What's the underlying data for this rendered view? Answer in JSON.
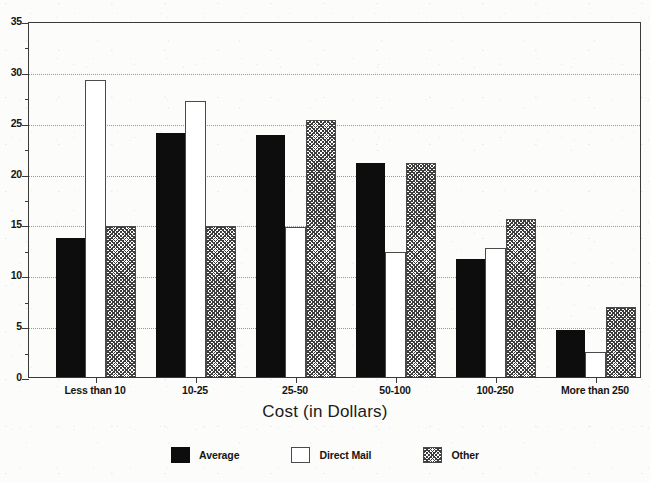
{
  "chart_data": {
    "type": "bar",
    "title": "",
    "xlabel": "Cost (in Dollars)",
    "ylabel": "",
    "categories": [
      "Less than 10",
      "10-25",
      "25-50",
      "50-100",
      "100-250",
      "More than 250"
    ],
    "series": [
      {
        "name": "Average",
        "values": [
          13.7,
          24.0,
          23.8,
          21.0,
          11.6,
          4.6
        ],
        "style": "solid-black",
        "color": "#0d0d0d"
      },
      {
        "name": "Direct Mail",
        "values": [
          29.2,
          27.1,
          14.7,
          12.3,
          12.7,
          2.5
        ],
        "style": "outline-white",
        "color": "#ffffff"
      },
      {
        "name": "Other",
        "values": [
          14.8,
          14.8,
          25.3,
          21.0,
          15.5,
          6.9
        ],
        "style": "hatched-gray",
        "color": "#808080"
      }
    ],
    "ylim": [
      0,
      35
    ],
    "ytick_labels": [
      "0",
      "5",
      "10",
      "15",
      "20",
      "25",
      "30",
      "35"
    ],
    "ytick_values": [
      0,
      5,
      10,
      15,
      20,
      25,
      30,
      35
    ],
    "yminor_values": [
      2.5,
      7.5,
      12.5,
      17.5,
      22.5,
      27.5,
      32.5
    ],
    "grid": "horizontal-dotted",
    "legend_position": "bottom-center"
  },
  "axis": {
    "x_title": "Cost (in Dollars)"
  },
  "legend": {
    "items": [
      {
        "label": "Average",
        "swatch": "solid-black-swatch"
      },
      {
        "label": "Direct Mail",
        "swatch": "outline-white-swatch"
      },
      {
        "label": "Other",
        "swatch": "hatched-gray-swatch"
      }
    ]
  },
  "colors": {
    "bar_average": "#0d0d0d",
    "bar_direct_mail": "#ffffff",
    "bar_other_hatch": "#3d3d3d",
    "axis": "#3a3a3a",
    "gridline": "#9a9a9a",
    "background": "#fcfcfa"
  }
}
